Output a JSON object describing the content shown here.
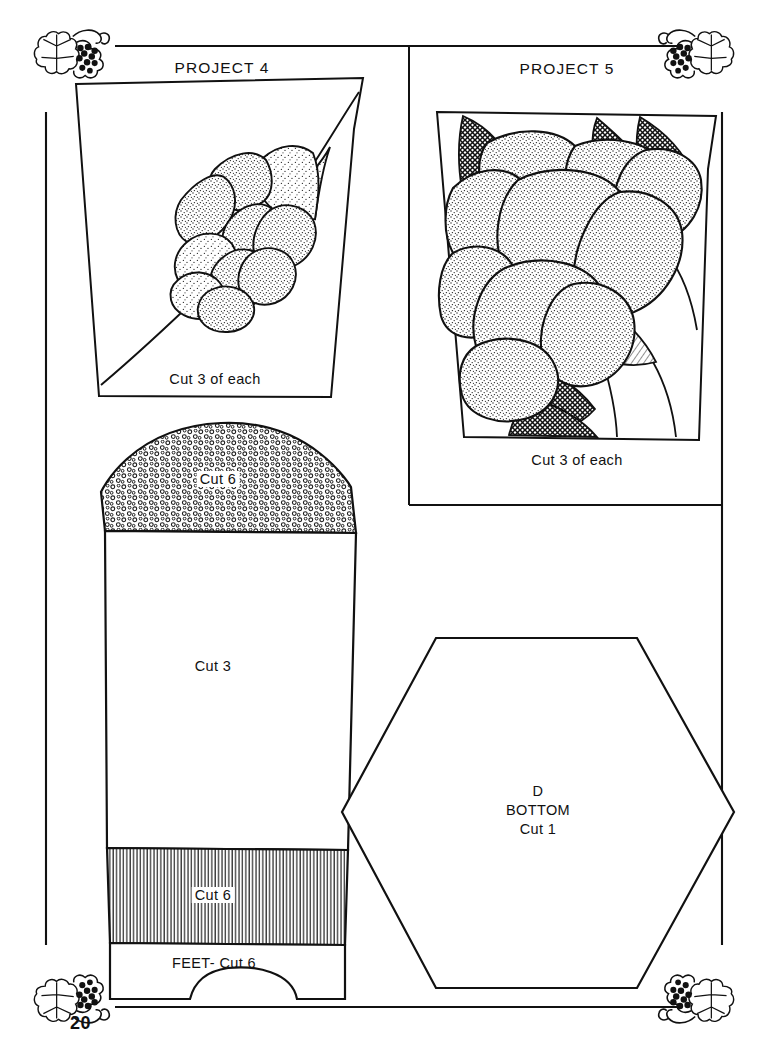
{
  "page": {
    "number": "20",
    "background_color": "#ffffff",
    "ink_color": "#111111",
    "width": 768,
    "height": 1051,
    "kind": "craft-pattern-template-page"
  },
  "ornaments": {
    "name": "grape-leaf-vine-corner-ornament",
    "corners": [
      "top-left",
      "top-right",
      "bottom-left",
      "bottom-right"
    ]
  },
  "sections": {
    "project4": {
      "title": "PROJECT 4",
      "caption": "Cut 3 of each",
      "artwork": "stippled-rose-cluster-on-diagonal-stem"
    },
    "project5": {
      "title": "PROJECT 5",
      "caption": "Cut 3 of each",
      "artwork": "large-stippled-rose-with-crosshatched-leaves"
    }
  },
  "patterns": {
    "dome_top": {
      "label": "Cut 6",
      "texture": "open-circle-dots",
      "name": "basket-top-arc-piece"
    },
    "body": {
      "label": "Cut 3",
      "texture": "plain",
      "name": "basket-body-piece"
    },
    "band": {
      "label": "Cut 6",
      "texture": "vertical-lines",
      "name": "basket-lower-band-piece"
    },
    "feet": {
      "label": "FEET- Cut 6",
      "texture": "plain",
      "name": "basket-feet-piece"
    },
    "hexagon": {
      "letter": "D",
      "name_line": "BOTTOM",
      "cut_line": "Cut 1",
      "name": "basket-bottom-hexagon-piece"
    }
  }
}
